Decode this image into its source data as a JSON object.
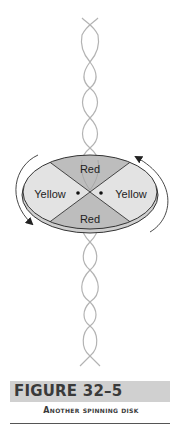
{
  "figure": {
    "disk": {
      "segments": [
        {
          "position": "top",
          "label": "Red",
          "fill": "#bdbdbd"
        },
        {
          "position": "left",
          "label": "Yellow",
          "fill": "#e3e3e3"
        },
        {
          "position": "right",
          "label": "Yellow",
          "fill": "#e3e3e3"
        },
        {
          "position": "bottom",
          "label": "Red",
          "fill": "#bdbdbd"
        }
      ],
      "rotation_arrows": 2
    },
    "helix_color": "#b0b0b0"
  },
  "caption": {
    "title": "FIGURE 32–5",
    "subtitle": "Another spinning disk"
  }
}
